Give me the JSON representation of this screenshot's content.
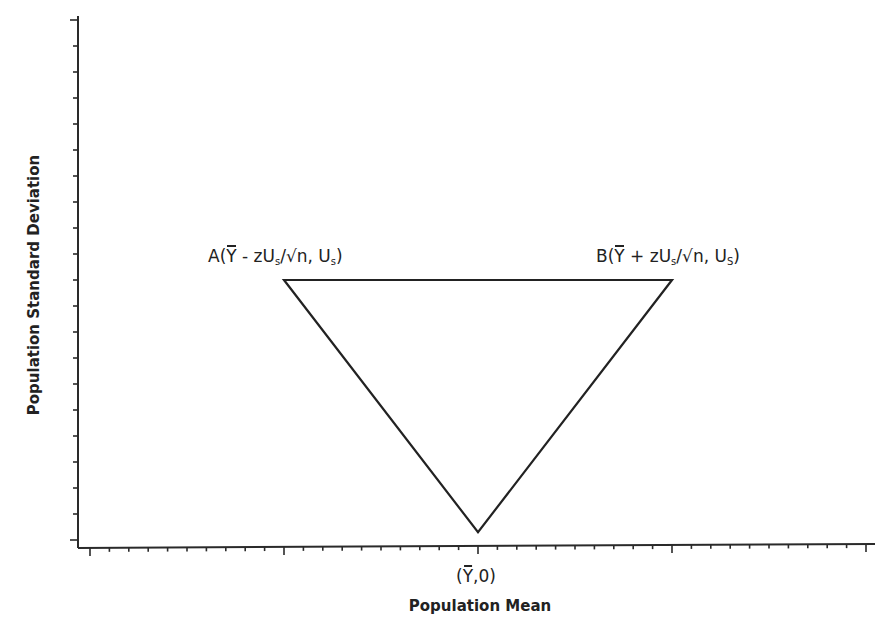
{
  "chart_data": {
    "type": "diagram-triangle",
    "title": "",
    "xlabel": "Population Mean",
    "ylabel": "Population Standard Deviation",
    "x_axis": {
      "range": [
        -20,
        20
      ],
      "minor_tick_step": 1,
      "major_tick_step": 10,
      "major_ticks": [
        -20,
        -10,
        0,
        10,
        20
      ],
      "tick_labels_shown": false
    },
    "y_axis": {
      "range": [
        0,
        20
      ],
      "tick_step": 1,
      "tick_count": 21,
      "tick_labels_shown": false
    },
    "grid": false,
    "legend": null,
    "points": [
      {
        "id": "A",
        "x": -10,
        "y": 10,
        "label_prefix": "A(",
        "label_ybar": "Y",
        "label_mid": " - zU",
        "label_sub": "s",
        "label_mid2": "/√n, U",
        "label_sub2": "s",
        "label_suffix": ")"
      },
      {
        "id": "B",
        "x": 10,
        "y": 10,
        "label_prefix": "B(",
        "label_ybar": "Y",
        "label_mid": " + zU",
        "label_sub": "s",
        "label_mid2": "/√n, U",
        "label_sub2": "S",
        "label_suffix": ")"
      },
      {
        "id": "origin",
        "x": 0,
        "y": 0.3,
        "label_prefix": "(",
        "label_ybar": "Y",
        "label_suffix": ",0)"
      }
    ],
    "shape": "inverted triangle connecting A, B and the point (Ȳ, 0)"
  },
  "colors": {
    "ink": "#222222",
    "background": "#ffffff"
  }
}
